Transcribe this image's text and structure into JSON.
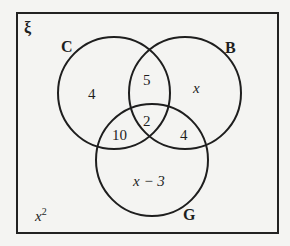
{
  "diagram": {
    "type": "venn",
    "universal_symbol": "ξ",
    "sets": [
      {
        "name": "C",
        "label": "C"
      },
      {
        "name": "B",
        "label": "B"
      },
      {
        "name": "G",
        "label": "G"
      }
    ],
    "regions": {
      "C_only": "4",
      "B_only": "x",
      "G_only": "x − 3",
      "C_and_B_only": "5",
      "C_and_G_only": "10",
      "B_and_G_only": "4",
      "C_and_B_and_G": "2",
      "outside": "x",
      "outside_exponent": "2"
    },
    "colors": {
      "line": "#1e1e1e",
      "background": "#f4f4f2"
    }
  }
}
